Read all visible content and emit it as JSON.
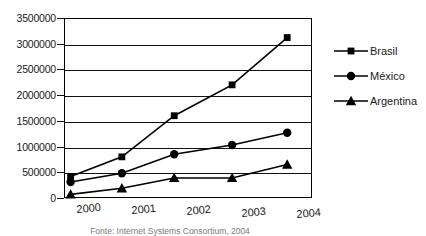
{
  "chart_data": {
    "type": "line",
    "title": "",
    "xlabel": "",
    "ylabel": "",
    "x": [
      2000,
      2001,
      2002,
      2003,
      2004
    ],
    "xtick_labels": [
      "2000",
      "2001",
      "2002",
      "2003",
      "2004"
    ],
    "ytick_labels": [
      "0",
      "500000",
      "1000000",
      "1500000",
      "2000000",
      "2500000",
      "3000000",
      "3500000"
    ],
    "ytick_values": [
      0,
      500000,
      1000000,
      1500000,
      2000000,
      2500000,
      3000000,
      3500000
    ],
    "ylim": [
      0,
      3500000
    ],
    "xlim": [
      1999.5,
      2004
    ],
    "grid": true,
    "legend_position": "right",
    "point_x": [
      1999.62,
      2000.55,
      2001.5,
      2002.55,
      2003.55
    ],
    "series": [
      {
        "name": "Brasil",
        "marker": "square",
        "color": "#000000",
        "values": [
          420000,
          800000,
          1600000,
          2200000,
          3120000
        ]
      },
      {
        "name": "México",
        "marker": "circle",
        "color": "#000000",
        "values": [
          310000,
          480000,
          850000,
          1030000,
          1270000
        ]
      },
      {
        "name": "Argentina",
        "marker": "triangle",
        "color": "#000000",
        "values": [
          70000,
          190000,
          390000,
          390000,
          650000
        ]
      }
    ],
    "caption": "Fonte: Internet Systems Consortium, 2004"
  }
}
